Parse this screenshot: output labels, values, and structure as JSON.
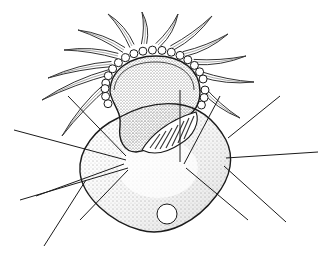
{
  "diagram": {
    "labels": [],
    "colors": {
      "ink": "#1a1a1a",
      "stipple": "#555555",
      "background": "#ffffff"
    },
    "cilia": [
      {
        "x1": 110,
        "y1": 72,
        "x2": 42,
        "y2": 100
      },
      {
        "x1": 112,
        "y1": 64,
        "x2": 48,
        "y2": 78
      },
      {
        "x1": 118,
        "y1": 56,
        "x2": 64,
        "y2": 50
      },
      {
        "x1": 124,
        "y1": 50,
        "x2": 78,
        "y2": 30
      },
      {
        "x1": 132,
        "y1": 46,
        "x2": 108,
        "y2": 14
      },
      {
        "x1": 144,
        "y1": 44,
        "x2": 142,
        "y2": 12
      },
      {
        "x1": 158,
        "y1": 45,
        "x2": 178,
        "y2": 14
      },
      {
        "x1": 172,
        "y1": 48,
        "x2": 212,
        "y2": 16
      },
      {
        "x1": 184,
        "y1": 54,
        "x2": 228,
        "y2": 34
      },
      {
        "x1": 194,
        "y1": 62,
        "x2": 246,
        "y2": 56
      },
      {
        "x1": 200,
        "y1": 74,
        "x2": 254,
        "y2": 82
      },
      {
        "x1": 202,
        "y1": 88,
        "x2": 240,
        "y2": 118
      },
      {
        "x1": 108,
        "y1": 84,
        "x2": 62,
        "y2": 136
      }
    ],
    "leader_lines": [
      {
        "x1": 14,
        "y1": 130,
        "x2": 126,
        "y2": 160
      },
      {
        "x1": 20,
        "y1": 200,
        "x2": 128,
        "y2": 168
      },
      {
        "x1": 36,
        "y1": 196,
        "x2": 124,
        "y2": 164
      },
      {
        "x1": 44,
        "y1": 246,
        "x2": 86,
        "y2": 180
      },
      {
        "x1": 80,
        "y1": 220,
        "x2": 128,
        "y2": 170
      },
      {
        "x1": 68,
        "y1": 96,
        "x2": 126,
        "y2": 156
      },
      {
        "x1": 180,
        "y1": 90,
        "x2": 180,
        "y2": 162
      },
      {
        "x1": 220,
        "y1": 96,
        "x2": 184,
        "y2": 164
      },
      {
        "x1": 280,
        "y1": 96,
        "x2": 228,
        "y2": 138
      },
      {
        "x1": 318,
        "y1": 152,
        "x2": 226,
        "y2": 158
      },
      {
        "x1": 286,
        "y1": 222,
        "x2": 224,
        "y2": 166
      },
      {
        "x1": 248,
        "y1": 220,
        "x2": 186,
        "y2": 168
      }
    ]
  }
}
